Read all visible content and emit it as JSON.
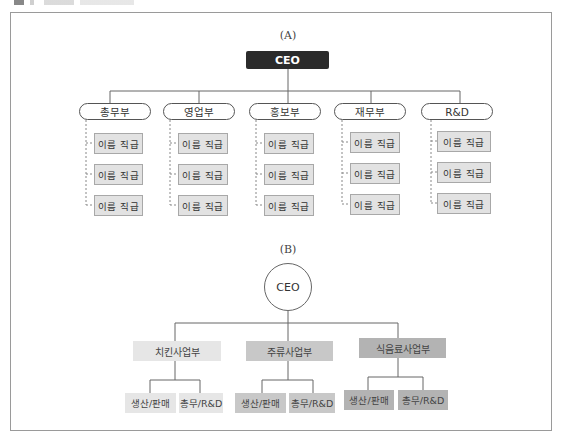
{
  "colors": {
    "ceo_a_bg": "#2b2b2b",
    "member_bg": "#e2e2e2",
    "division_light": "#e6e6e6",
    "division_medium": "#c8c8c8",
    "division_dark": "#b3b3b3",
    "line": "#666666"
  },
  "chart_a": {
    "label": "(A)",
    "ceo": "CEO",
    "departments": [
      {
        "name": "총무부",
        "members": [
          "이름 직급",
          "이름 직급",
          "이름 직급"
        ]
      },
      {
        "name": "영업부",
        "members": [
          "이름 직급",
          "이름 직급",
          "이름 직급"
        ]
      },
      {
        "name": "홍보부",
        "members": [
          "이름 직급",
          "이름 직급",
          "이름 직급"
        ]
      },
      {
        "name": "재무부",
        "members": [
          "이름 직급",
          "이름 직급",
          "이름 직급"
        ]
      },
      {
        "name": "R&D",
        "members": [
          "이름 직급",
          "이름 직급",
          "이름 직급"
        ]
      }
    ]
  },
  "chart_b": {
    "label": "(B)",
    "ceo": "CEO",
    "divisions": [
      {
        "name": "치킨사업부",
        "shade": "light",
        "subs": [
          "생산/판매",
          "총무/R&D"
        ]
      },
      {
        "name": "주류사업부",
        "shade": "medium",
        "subs": [
          "생산/판매",
          "총무/R&D"
        ]
      },
      {
        "name": "식음료사업부",
        "shade": "dark",
        "subs": [
          "생산/판매",
          "총무/R&D"
        ]
      }
    ]
  }
}
